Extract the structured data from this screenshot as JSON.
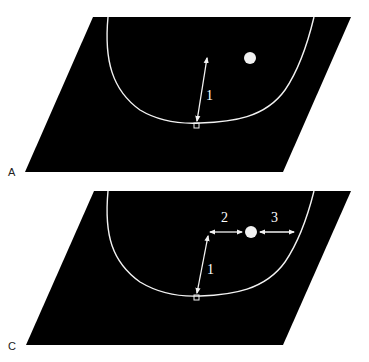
{
  "figure": {
    "panels": [
      {
        "id": "A",
        "label": "A",
        "arrows": [
          {
            "label": "1",
            "description": "double-headed arrow from curve bottom marker upward"
          }
        ],
        "has_dot": true
      },
      {
        "id": "C",
        "label": "C",
        "arrows": [
          {
            "label": "1",
            "description": "double-headed arrow from curve bottom marker upward"
          },
          {
            "label": "2",
            "description": "horizontal double-headed arrow to dot"
          },
          {
            "label": "3",
            "description": "horizontal double-headed arrow from dot to curve"
          }
        ],
        "has_dot": true
      }
    ],
    "colors": {
      "plane": "#000000",
      "lines": "#f2f2f2",
      "background": "#ffffff",
      "label_text": "#222222"
    }
  }
}
